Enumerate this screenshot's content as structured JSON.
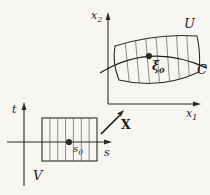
{
  "figure": {
    "background_color": "#f7f6f3",
    "ink_color": "#2e2a26",
    "target_plane": {
      "axis_vertical_label": "x",
      "axis_vertical_sub": "2",
      "axis_horizontal_label": "x",
      "axis_horizontal_sub": "1",
      "region_label": "U",
      "curve_label": "C",
      "point_label": "ξ",
      "point_sub": "0"
    },
    "parameter_plane": {
      "axis_vertical_label": "t",
      "axis_horizontal_label": "s",
      "region_label": "V",
      "point_label": "s",
      "point_sub": "0"
    },
    "map": {
      "label": "X"
    }
  }
}
